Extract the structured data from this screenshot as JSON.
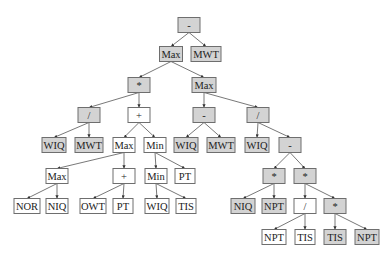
{
  "diagram": {
    "type": "expression-tree",
    "colors": {
      "shaded_fill": "#d3d3d3",
      "plain_fill": "#ffffff",
      "border": "#6e6e6e",
      "edge": "#555555",
      "text": "#222222"
    },
    "nodes": [
      {
        "id": "n0",
        "label": "-",
        "x": 189,
        "y": 25,
        "w": 22,
        "shaded": true
      },
      {
        "id": "n1",
        "label": "Max",
        "x": 171,
        "y": 54,
        "w": 23,
        "shaded": true
      },
      {
        "id": "n2",
        "label": "MWT",
        "x": 206,
        "y": 54,
        "w": 30,
        "shaded": true
      },
      {
        "id": "n3",
        "label": "*",
        "x": 139,
        "y": 85,
        "w": 22,
        "shaded": true
      },
      {
        "id": "n4",
        "label": "Max",
        "x": 204,
        "y": 85,
        "w": 24,
        "shaded": true
      },
      {
        "id": "n5",
        "label": "/",
        "x": 89,
        "y": 115,
        "w": 22,
        "shaded": true
      },
      {
        "id": "n6",
        "label": "+",
        "x": 139,
        "y": 115,
        "w": 22,
        "shaded": false
      },
      {
        "id": "n7",
        "label": "-",
        "x": 204,
        "y": 115,
        "w": 22,
        "shaded": true
      },
      {
        "id": "n8",
        "label": "/",
        "x": 258,
        "y": 115,
        "w": 22,
        "shaded": true
      },
      {
        "id": "n9",
        "label": "WIQ",
        "x": 54,
        "y": 145,
        "w": 24,
        "shaded": true
      },
      {
        "id": "n10",
        "label": "MWT",
        "x": 89,
        "y": 145,
        "w": 28,
        "shaded": true
      },
      {
        "id": "n11",
        "label": "Max",
        "x": 124,
        "y": 145,
        "w": 22,
        "shaded": false
      },
      {
        "id": "n12",
        "label": "Min",
        "x": 155,
        "y": 145,
        "w": 22,
        "shaded": false
      },
      {
        "id": "n13",
        "label": "WIQ",
        "x": 186,
        "y": 145,
        "w": 24,
        "shaded": true
      },
      {
        "id": "n14",
        "label": "MWT",
        "x": 221,
        "y": 145,
        "w": 28,
        "shaded": true
      },
      {
        "id": "n15",
        "label": "WIQ",
        "x": 257,
        "y": 145,
        "w": 24,
        "shaded": true
      },
      {
        "id": "n16",
        "label": "-",
        "x": 290,
        "y": 145,
        "w": 22,
        "shaded": true
      },
      {
        "id": "n17",
        "label": "Max",
        "x": 57,
        "y": 176,
        "w": 22,
        "shaded": false
      },
      {
        "id": "n18",
        "label": "+",
        "x": 124,
        "y": 176,
        "w": 22,
        "shaded": false
      },
      {
        "id": "n19",
        "label": "Min",
        "x": 156,
        "y": 176,
        "w": 22,
        "shaded": false
      },
      {
        "id": "n20",
        "label": "PT",
        "x": 185,
        "y": 176,
        "w": 20,
        "shaded": false
      },
      {
        "id": "n21",
        "label": "*",
        "x": 274,
        "y": 176,
        "w": 22,
        "shaded": true
      },
      {
        "id": "n22",
        "label": "*",
        "x": 305,
        "y": 176,
        "w": 22,
        "shaded": true
      },
      {
        "id": "n23",
        "label": "NOR",
        "x": 27,
        "y": 206,
        "w": 26,
        "shaded": false
      },
      {
        "id": "n24",
        "label": "NIQ",
        "x": 57,
        "y": 206,
        "w": 22,
        "shaded": false
      },
      {
        "id": "n25",
        "label": "OWT",
        "x": 93,
        "y": 206,
        "w": 26,
        "shaded": false
      },
      {
        "id": "n26",
        "label": "PT",
        "x": 123,
        "y": 206,
        "w": 20,
        "shaded": false
      },
      {
        "id": "n27",
        "label": "WIQ",
        "x": 157,
        "y": 206,
        "w": 24,
        "shaded": false
      },
      {
        "id": "n28",
        "label": "TIS",
        "x": 186,
        "y": 206,
        "w": 20,
        "shaded": false
      },
      {
        "id": "n29",
        "label": "NIQ",
        "x": 243,
        "y": 206,
        "w": 24,
        "shaded": true
      },
      {
        "id": "n30",
        "label": "NPT",
        "x": 274,
        "y": 206,
        "w": 24,
        "shaded": true
      },
      {
        "id": "n31",
        "label": "/",
        "x": 305,
        "y": 206,
        "w": 22,
        "shaded": false
      },
      {
        "id": "n32",
        "label": "*",
        "x": 335,
        "y": 206,
        "w": 22,
        "shaded": true
      },
      {
        "id": "n33",
        "label": "NPT",
        "x": 274,
        "y": 237,
        "w": 24,
        "shaded": false
      },
      {
        "id": "n34",
        "label": "TIS",
        "x": 305,
        "y": 237,
        "w": 20,
        "shaded": false
      },
      {
        "id": "n35",
        "label": "TIS",
        "x": 335,
        "y": 237,
        "w": 22,
        "shaded": true
      },
      {
        "id": "n36",
        "label": "NPT",
        "x": 367,
        "y": 237,
        "w": 24,
        "shaded": true
      }
    ],
    "edges": [
      [
        "n0",
        "n1"
      ],
      [
        "n0",
        "n2"
      ],
      [
        "n1",
        "n3"
      ],
      [
        "n1",
        "n4"
      ],
      [
        "n3",
        "n5"
      ],
      [
        "n3",
        "n6"
      ],
      [
        "n4",
        "n7"
      ],
      [
        "n4",
        "n8"
      ],
      [
        "n5",
        "n9"
      ],
      [
        "n5",
        "n10"
      ],
      [
        "n6",
        "n11"
      ],
      [
        "n6",
        "n12"
      ],
      [
        "n7",
        "n13"
      ],
      [
        "n7",
        "n14"
      ],
      [
        "n8",
        "n15"
      ],
      [
        "n8",
        "n16"
      ],
      [
        "n11",
        "n17"
      ],
      [
        "n11",
        "n18"
      ],
      [
        "n12",
        "n19"
      ],
      [
        "n12",
        "n20"
      ],
      [
        "n16",
        "n21"
      ],
      [
        "n16",
        "n22"
      ],
      [
        "n17",
        "n23"
      ],
      [
        "n17",
        "n24"
      ],
      [
        "n18",
        "n25"
      ],
      [
        "n18",
        "n26"
      ],
      [
        "n19",
        "n27"
      ],
      [
        "n19",
        "n28"
      ],
      [
        "n21",
        "n29"
      ],
      [
        "n21",
        "n30"
      ],
      [
        "n22",
        "n31"
      ],
      [
        "n22",
        "n32"
      ],
      [
        "n31",
        "n33"
      ],
      [
        "n31",
        "n34"
      ],
      [
        "n32",
        "n35"
      ],
      [
        "n32",
        "n36"
      ]
    ],
    "node_height": 15
  }
}
